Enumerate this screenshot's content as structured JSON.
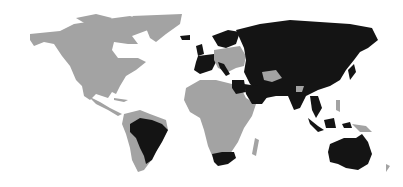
{
  "map": {
    "type": "choropleth-world",
    "legend": [],
    "colors": {
      "highlighted": "#141414",
      "other": "#a3a3a3",
      "background": "#ffffff"
    },
    "highlighted_regions": [
      "Iceland",
      "Ireland",
      "United Kingdom",
      "France",
      "Spain",
      "Portugal",
      "Italy",
      "Scandinavia",
      "Russia",
      "Kazakhstan",
      "Middle East",
      "Egypt",
      "Iran",
      "India",
      "China",
      "Mongolia",
      "Southeast Asia",
      "Japan",
      "Indonesia",
      "Australia",
      "Brazil",
      "South Africa"
    ],
    "other_regions": [
      "North America",
      "Greenland",
      "Central America",
      "Rest of South America",
      "Africa",
      "Madagascar",
      "Central Europe",
      "Papua New Guinea"
    ]
  }
}
